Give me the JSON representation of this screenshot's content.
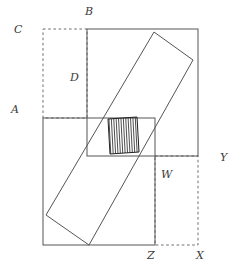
{
  "figure": {
    "kind": "geometry-diagram",
    "canvas": {
      "width": 237,
      "height": 278
    },
    "stroke_color": "#555555",
    "dashed_color": "#6e6e6e",
    "hatch_color": "#222222",
    "background": "#ffffff",
    "labels": [
      {
        "id": "A",
        "text": "A",
        "x": 11,
        "y": 104
      },
      {
        "id": "B",
        "text": "B",
        "x": 85,
        "y": 6
      },
      {
        "id": "C",
        "text": "C",
        "x": 14,
        "y": 24
      },
      {
        "id": "D",
        "text": "D",
        "x": 70,
        "y": 72
      },
      {
        "id": "W",
        "text": "W",
        "x": 161,
        "y": 169
      },
      {
        "id": "X",
        "text": "X",
        "x": 196,
        "y": 250
      },
      {
        "id": "Y",
        "text": "Y",
        "x": 220,
        "y": 152
      },
      {
        "id": "Z",
        "text": "Z",
        "x": 147,
        "y": 250
      }
    ],
    "shapes": {
      "dashed_rect_top_left": {
        "name": "dashed-rectangle-C",
        "x": 43,
        "y": 29,
        "width": 44,
        "height": 89
      },
      "dashed_rect_bottom_right": {
        "name": "dashed-rectangle-X",
        "x": 155,
        "y": 156,
        "width": 43,
        "height": 89
      },
      "tall_rect": {
        "name": "tall-rectangle-BD",
        "x": 87,
        "y": 29,
        "width": 111,
        "height": 127
      },
      "square": {
        "name": "square-AZ",
        "x": 43,
        "y": 118,
        "width": 112,
        "height": 127
      },
      "rotated_rect": {
        "name": "rotated-rectangle",
        "points": "154,32 193,60 89,245 46,215"
      },
      "hatched_rect": {
        "name": "hatched-overlap-region",
        "points": "108,119 137,117 139,152 110,154",
        "hatch_spacing": 2.4
      }
    }
  }
}
